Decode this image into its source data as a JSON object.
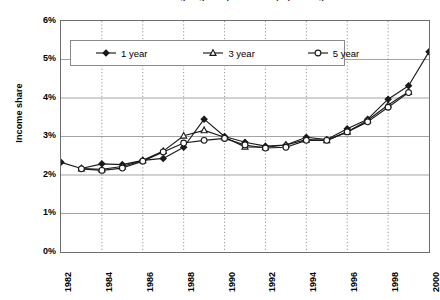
{
  "chart_title": "Share of income going to top earners by spell length",
  "axes": {
    "y_title": "Income share",
    "y_ticks": [
      "6%",
      "5%",
      "4%",
      "3%",
      "2%",
      "1%",
      "0%"
    ],
    "x_ticks": [
      "1982",
      "1984",
      "1986",
      "1988",
      "1990",
      "1992",
      "1994",
      "1996",
      "1998",
      "2000"
    ]
  },
  "legend": {
    "items": [
      {
        "label": "1 year",
        "marker": "filled-diamond",
        "color": "#000000"
      },
      {
        "label": "3 year",
        "marker": "open-triangle",
        "color": "#000000"
      },
      {
        "label": "5 year",
        "marker": "open-circle",
        "color": "#000000"
      }
    ]
  },
  "chart_data": {
    "type": "line",
    "title": "Share of income going to top earners by spell length",
    "xlabel": "",
    "ylabel": "Income share",
    "xlim": [
      1982,
      2000
    ],
    "ylim": [
      0,
      6
    ],
    "y_unit": "percent",
    "grid": {
      "horizontal": true,
      "vertical": true,
      "vertical_style": "dotted"
    },
    "legend_position": "top-inside",
    "x": [
      1982,
      1983,
      1984,
      1985,
      1986,
      1987,
      1988,
      1989,
      1990,
      1991,
      1992,
      1993,
      1994,
      1995,
      1996,
      1997,
      1998,
      1999,
      2000
    ],
    "series": [
      {
        "name": "1 year",
        "marker": "filled-diamond",
        "values": [
          2.33,
          2.17,
          2.29,
          2.27,
          2.38,
          2.43,
          2.72,
          3.45,
          3.0,
          2.85,
          2.75,
          2.78,
          2.98,
          2.92,
          3.2,
          3.45,
          3.97,
          4.32,
          5.2
        ]
      },
      {
        "name": "3 year",
        "marker": "open-triangle",
        "values": [
          null,
          2.17,
          2.15,
          2.22,
          2.38,
          2.62,
          3.02,
          3.16,
          2.98,
          2.73,
          2.72,
          2.78,
          2.92,
          2.9,
          3.12,
          3.42,
          3.82,
          4.16,
          null
        ]
      },
      {
        "name": "5 year",
        "marker": "open-circle",
        "values": [
          null,
          2.16,
          2.12,
          2.18,
          2.36,
          2.6,
          2.83,
          2.9,
          2.95,
          2.78,
          2.7,
          2.72,
          2.9,
          2.9,
          3.12,
          3.38,
          3.76,
          4.14,
          null
        ]
      }
    ]
  },
  "colors": {
    "line": "#1a1a1a",
    "grid_horizontal": "#9a9a9a",
    "grid_vertical": "#8c8c8c",
    "frame": "#6e6e6e",
    "background": "#ffffff"
  }
}
